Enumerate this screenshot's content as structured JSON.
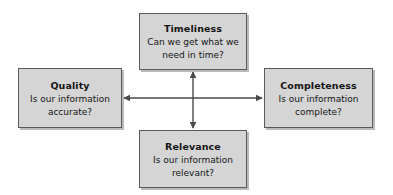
{
  "diagram": {
    "type": "cross-arrow-concept-map",
    "background_color": "#ffffff",
    "box_fill_color": "#d5d5d5",
    "box_border_color": "#5a5a5a",
    "text_color": "#141414",
    "arrow_color": "#4a4a4a",
    "nodes": {
      "timeliness": {
        "title": "Timeliness",
        "question_line1": "Can we get what we",
        "question_line2": "need in time?",
        "question": "Can we get what we need in time?",
        "position": "top"
      },
      "quality": {
        "title": "Quality",
        "question_line1": "Is our information",
        "question_line2": "accurate?",
        "question": "Is our information accurate?",
        "position": "left"
      },
      "completeness": {
        "title": "Completeness",
        "question_line1": "Is our information",
        "question_line2": "complete?",
        "question": "Is our information complete?",
        "position": "right"
      },
      "relevance": {
        "title": "Relevance",
        "question_line1": "Is our information",
        "question_line2": "relevant?",
        "question": "Is our information relevant?",
        "position": "bottom"
      }
    },
    "connectors": [
      {
        "name": "horizontal-arrow",
        "from": "quality",
        "to": "completeness",
        "style": "double-headed",
        "orientation": "horizontal"
      },
      {
        "name": "vertical-arrow",
        "from": "timeliness",
        "to": "relevance",
        "style": "double-headed",
        "orientation": "vertical"
      }
    ]
  }
}
